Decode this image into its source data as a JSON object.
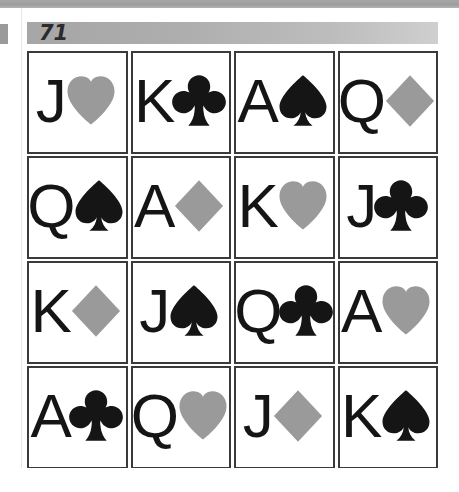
{
  "page": {
    "puzzle_number": "71",
    "background_color": "#ffffff",
    "header_bar_color": "#b0b0b0",
    "top_band_color": "#a8a8a8"
  },
  "colors": {
    "black_suit": "#151515",
    "gray_suit": "#9a9a9a",
    "rank_text": "#151515",
    "card_border": "#3a3a3a"
  },
  "grid": {
    "rows": 4,
    "columns": 4,
    "cards": [
      {
        "rank": "J",
        "suit": "heart",
        "suit_symbol": "♥",
        "suit_color": "#9a9a9a",
        "label": "J of hearts"
      },
      {
        "rank": "K",
        "suit": "club",
        "suit_symbol": "♣",
        "suit_color": "#151515",
        "label": "K of clubs"
      },
      {
        "rank": "A",
        "suit": "spade",
        "suit_symbol": "♠",
        "suit_color": "#151515",
        "label": "A of spades"
      },
      {
        "rank": "Q",
        "suit": "diamond",
        "suit_symbol": "♦",
        "suit_color": "#9a9a9a",
        "label": "Q of diamonds"
      },
      {
        "rank": "Q",
        "suit": "spade",
        "suit_symbol": "♠",
        "suit_color": "#151515",
        "label": "Q of spades"
      },
      {
        "rank": "A",
        "suit": "diamond",
        "suit_symbol": "♦",
        "suit_color": "#9a9a9a",
        "label": "A of diamonds"
      },
      {
        "rank": "K",
        "suit": "heart",
        "suit_symbol": "♥",
        "suit_color": "#9a9a9a",
        "label": "K of hearts"
      },
      {
        "rank": "J",
        "suit": "club",
        "suit_symbol": "♣",
        "suit_color": "#151515",
        "label": "J of clubs"
      },
      {
        "rank": "K",
        "suit": "diamond",
        "suit_symbol": "♦",
        "suit_color": "#9a9a9a",
        "label": "K of diamonds"
      },
      {
        "rank": "J",
        "suit": "spade",
        "suit_symbol": "♠",
        "suit_color": "#151515",
        "label": "J of spades"
      },
      {
        "rank": "Q",
        "suit": "club",
        "suit_symbol": "♣",
        "suit_color": "#151515",
        "label": "Q of clubs"
      },
      {
        "rank": "A",
        "suit": "heart",
        "suit_symbol": "♥",
        "suit_color": "#9a9a9a",
        "label": "A of hearts"
      },
      {
        "rank": "A",
        "suit": "club",
        "suit_symbol": "♣",
        "suit_color": "#151515",
        "label": "A of clubs"
      },
      {
        "rank": "Q",
        "suit": "heart",
        "suit_symbol": "♥",
        "suit_color": "#9a9a9a",
        "label": "Q of hearts"
      },
      {
        "rank": "J",
        "suit": "diamond",
        "suit_symbol": "♦",
        "suit_color": "#9a9a9a",
        "label": "J of diamonds"
      },
      {
        "rank": "K",
        "suit": "spade",
        "suit_symbol": "♠",
        "suit_color": "#151515",
        "label": "K of spades"
      }
    ]
  }
}
